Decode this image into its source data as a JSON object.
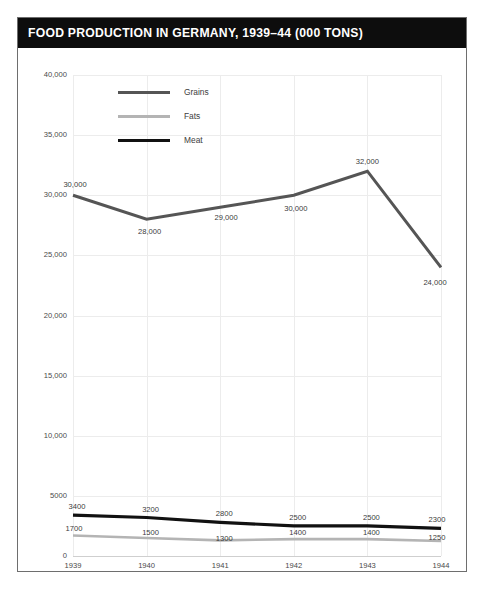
{
  "card": {
    "title": "FOOD PRODUCTION IN GERMANY, 1939–44 (000 TONS)"
  },
  "legend": {
    "position": "top-left-inside",
    "items": [
      {
        "label": "Grains",
        "color": "#555555"
      },
      {
        "label": "Fats",
        "color": "#b4b4b4"
      },
      {
        "label": "Meat",
        "color": "#111111"
      }
    ]
  },
  "axes": {
    "y_ticks": [
      "40,000",
      "35,000",
      "30,000",
      "25,000",
      "20,000",
      "15,000",
      "10,000",
      "5000",
      "0"
    ],
    "x_ticks": [
      "1939",
      "1940",
      "1941",
      "1942",
      "1943",
      "1944"
    ]
  },
  "labels": {
    "grains": [
      "30,000",
      "28,000",
      "29,000",
      "30,000",
      "32,000",
      "24,000"
    ],
    "meat": [
      "3400",
      "3200",
      "2800",
      "2500",
      "2500",
      "2300"
    ],
    "fats": [
      "1700",
      "1500",
      "1300",
      "1400",
      "1400",
      "1250"
    ]
  },
  "chart_data": {
    "type": "line",
    "title": "FOOD PRODUCTION IN GERMANY, 1939–44 (000 TONS)",
    "xlabel": "",
    "ylabel": "",
    "x": [
      1939,
      1940,
      1941,
      1942,
      1943,
      1944
    ],
    "categories": [
      "1939",
      "1940",
      "1941",
      "1942",
      "1943",
      "1944"
    ],
    "ylim": [
      0,
      40000
    ],
    "yticks": [
      0,
      5000,
      10000,
      15000,
      20000,
      25000,
      30000,
      35000,
      40000
    ],
    "ytick_labels": [
      "0",
      "5000",
      "10,000",
      "15,000",
      "20,000",
      "25,000",
      "30,000",
      "35,000",
      "40,000"
    ],
    "grid": true,
    "legend_position": "top-left",
    "series": [
      {
        "name": "Grains",
        "color": "#555555",
        "values": [
          30000,
          28000,
          29000,
          30000,
          32000,
          24000
        ]
      },
      {
        "name": "Fats",
        "color": "#b4b4b4",
        "values": [
          1700,
          1500,
          1300,
          1400,
          1400,
          1250
        ]
      },
      {
        "name": "Meat",
        "color": "#111111",
        "values": [
          3400,
          3200,
          2800,
          2500,
          2500,
          2300
        ]
      }
    ]
  }
}
